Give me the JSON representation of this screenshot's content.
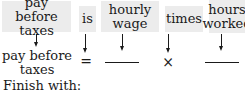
{
  "top_row": {
    "phrases": [
      {
        "line1": "pay before",
        "line2": "taxes"
      },
      {
        "line1": "is",
        "line2": ""
      },
      {
        "line1": "hourly",
        "line2": "wage"
      },
      {
        "line1": "times",
        "line2": ""
      },
      {
        "line1": "hours",
        "line2": "worked"
      }
    ]
  },
  "bottom_row": {
    "variable": {
      "line1": "pay before",
      "line2": "taxes"
    },
    "equals_symbol": "=",
    "blank_1": "",
    "times_symbol": "×",
    "blank_2": ""
  },
  "footer": {
    "instruction": "Finish with:"
  },
  "colors": {
    "box_background": "#ececec",
    "text": "#1a1a1a"
  }
}
